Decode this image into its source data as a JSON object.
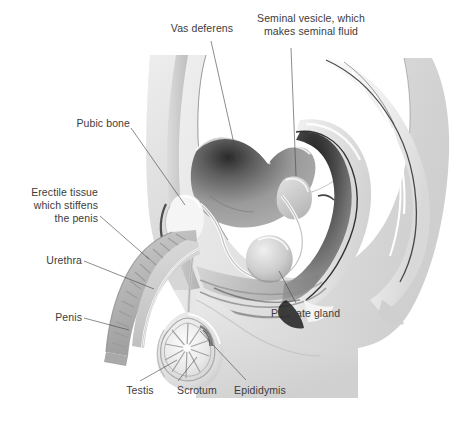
{
  "figure": {
    "background_color": "#ffffff",
    "label_text_color": "#3c3c3c",
    "leader_line_color": "#4a4a4a",
    "style": "grayscale medical illustration"
  },
  "labels": {
    "vas_deferens": "Vas deferens",
    "seminal_vesicle_line1": "Seminal vesicle, which",
    "seminal_vesicle_line2": "makes seminal fluid",
    "pubic_bone": "Pubic bone",
    "erectile_tissue_line1": "Erectile tissue",
    "erectile_tissue_line2": "which stiffens",
    "erectile_tissue_line3": "the penis",
    "urethra": "Urethra",
    "penis": "Penis",
    "prostate_gland": "Prostate gland",
    "testis": "Testis",
    "scrotum": "Scrotum",
    "epididymis": "Epididymis"
  }
}
